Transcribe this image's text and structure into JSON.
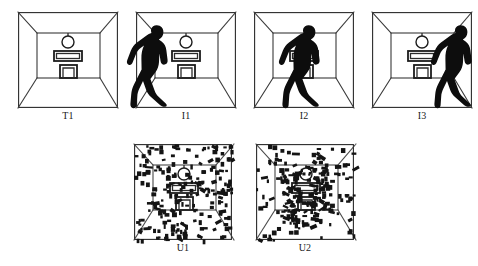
{
  "figure": {
    "background_color": "#ffffff",
    "ink_color": "#1a1a1a",
    "width": 478,
    "height": 266
  },
  "panels": [
    {
      "id": "T1",
      "label": "T1",
      "row": "top",
      "index": 0,
      "x": 18,
      "y": 12,
      "w": 100,
      "h": 96,
      "caption_y": 110,
      "content": "empty-room",
      "has_walker": false,
      "walker_x": null,
      "noise": false,
      "description": "Line-drawing room interior in one-point perspective with hanging lamp, table and fireplace; no figure."
    },
    {
      "id": "I1",
      "label": "I1",
      "row": "top",
      "index": 1,
      "x": 136,
      "y": 12,
      "w": 100,
      "h": 96,
      "caption_y": 110,
      "content": "room-with-walker",
      "has_walker": true,
      "walker_x": -6,
      "noise": false,
      "description": "Same room with black walking human silhouette at far left, overlapping the left frame edge."
    },
    {
      "id": "I2",
      "label": "I2",
      "row": "top",
      "index": 2,
      "x": 254,
      "y": 12,
      "w": 100,
      "h": 96,
      "caption_y": 110,
      "content": "room-with-walker",
      "has_walker": true,
      "walker_x": 28,
      "noise": false,
      "description": "Same room with black walking human silhouette near the centre, occluding the table."
    },
    {
      "id": "I3",
      "label": "I3",
      "row": "top",
      "index": 3,
      "x": 372,
      "y": 12,
      "w": 100,
      "h": 96,
      "caption_y": 110,
      "content": "room-with-walker",
      "has_walker": true,
      "walker_x": 62,
      "noise": false,
      "description": "Same room with black walking human silhouette at the right, overlapping the right frame edge."
    },
    {
      "id": "U1",
      "label": "U1",
      "row": "bottom",
      "index": 4,
      "x": 134,
      "y": 144,
      "w": 98,
      "h": 96,
      "caption_y": 242,
      "content": "room-masked",
      "has_walker": false,
      "walker_x": null,
      "noise": true,
      "noise_seed": 17,
      "noise_count": 210,
      "noise_center_bias": 0.0,
      "description": "Empty room scene masked by dense random black rectangular noise blocks."
    },
    {
      "id": "U2",
      "label": "U2",
      "row": "bottom",
      "index": 5,
      "x": 256,
      "y": 144,
      "w": 98,
      "h": 96,
      "caption_y": 242,
      "content": "room-masked-walker",
      "has_walker": false,
      "walker_x": null,
      "noise": true,
      "noise_seed": 43,
      "noise_count": 230,
      "noise_center_bias": 0.55,
      "description": "Room scene with figure masked by dense random black rectangular noise blocks, heavier toward the centre."
    }
  ],
  "room_geometry": {
    "frame": {
      "x": 0,
      "y": 0,
      "w": 100,
      "h": 96
    },
    "back_wall": {
      "x": 19,
      "y": 21,
      "w": 63,
      "h": 45
    },
    "corner_lines": [
      {
        "from": [
          0,
          0
        ],
        "to": [
          19,
          21
        ]
      },
      {
        "from": [
          100,
          0
        ],
        "to": [
          82,
          21
        ]
      },
      {
        "from": [
          0,
          96
        ],
        "to": [
          19,
          66
        ]
      },
      {
        "from": [
          100,
          96
        ],
        "to": [
          82,
          66
        ]
      }
    ],
    "lamp": {
      "cx": 50,
      "cy": 30,
      "r": 6,
      "stem_top": 21,
      "stem_bottom": 24
    },
    "table": {
      "x": 36,
      "y": 39,
      "w": 28,
      "h": 10,
      "inner_inset": 2.5
    },
    "fireplace": {
      "x": 42,
      "y": 53,
      "w": 17,
      "h": 13,
      "inner_inset": 3
    }
  },
  "walker": {
    "fill_color": "#0d0d0d",
    "pose": "walking-left-profile",
    "width": 40,
    "height": 82,
    "description": "Solid black human silhouette in mid-stride walking profile, arms swinging, head tilted forward."
  },
  "captions": {
    "font": "serif",
    "size_px": 10,
    "color": "#1a1a1a"
  }
}
